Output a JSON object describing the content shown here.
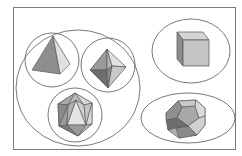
{
  "diagram": {
    "type": "grouping-diagram",
    "subject": "Platonic solids",
    "groups": [
      {
        "name": "triangular-faced solids",
        "members": [
          "tetrahedron",
          "octahedron",
          "icosahedron"
        ]
      },
      {
        "name": "square-faced solid",
        "members": [
          "cube"
        ]
      },
      {
        "name": "pentagonal-faced solid",
        "members": [
          "dodecahedron"
        ]
      }
    ],
    "solids": [
      {
        "id": "tetrahedron",
        "label": "Tetrahedron"
      },
      {
        "id": "octahedron",
        "label": "Octahedron"
      },
      {
        "id": "icosahedron",
        "label": "Icosahedron"
      },
      {
        "id": "cube",
        "label": "Cube"
      },
      {
        "id": "dodecahedron",
        "label": "Dodecahedron"
      }
    ],
    "colors": {
      "outline": "#555555",
      "face_light": "#dcdcdc",
      "face_mid": "#b4b4b4",
      "face_dark": "#8c8c8c",
      "face_darkest": "#6e6e6e",
      "background": "#ffffff"
    }
  }
}
